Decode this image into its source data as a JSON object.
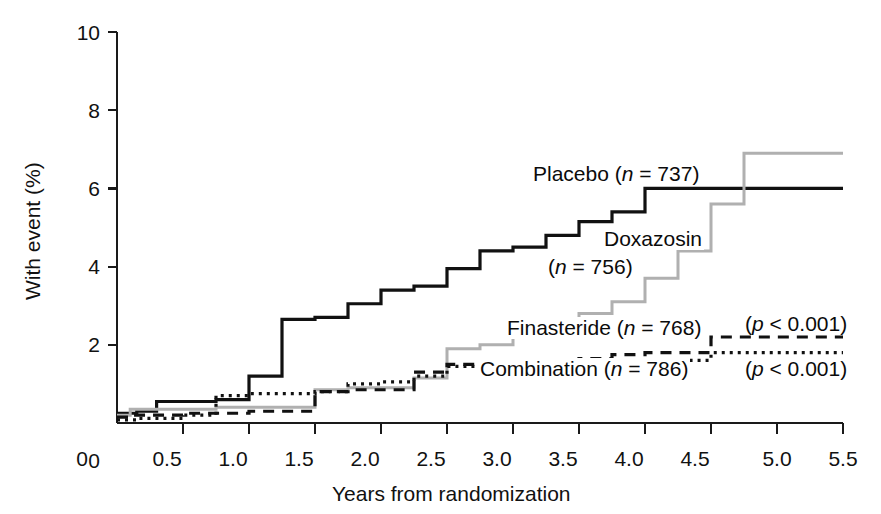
{
  "figure": {
    "background": "#ffffff",
    "width": 881,
    "height": 514
  },
  "axes": {
    "y_title": "With event (%)",
    "x_title": "Years from randomization",
    "y_ticks": [
      "0",
      "2",
      "4",
      "6",
      "8",
      "10"
    ],
    "x_ticks": [
      "0",
      "0.5",
      "1.0",
      "1.5",
      "2.0",
      "2.5",
      "3.0",
      "3.5",
      "4.0",
      "4.5",
      "5.0",
      "5.5"
    ],
    "axis_color": "#1a1a1a"
  },
  "annotations": {
    "placebo_label": "Placebo (",
    "placebo_n_italic": "n",
    "placebo_n_rest": " = 737)",
    "doxazosin_label_line1": "Doxazosin",
    "doxazosin_label_line2_pre": "(",
    "doxazosin_n_italic": "n",
    "doxazosin_n_rest": " = 756)",
    "finasteride_label": "Finasteride (",
    "finasteride_n_italic": "n",
    "finasteride_n_rest": " = 768)",
    "combination_label": "Combination (",
    "combination_n_italic": "n",
    "combination_n_rest": " = 786)",
    "pvalue_finasteride_pre": "(",
    "pvalue_finasteride_italic": "p",
    "pvalue_finasteride_rest": " < 0.001)",
    "pvalue_combination_pre": "(",
    "pvalue_combination_italic": "p",
    "pvalue_combination_rest": " < 0.001)"
  },
  "chart_data": {
    "type": "line",
    "subtype": "kaplan-meier-step",
    "title": "",
    "xlabel": "Years from randomization",
    "ylabel": "With event (%)",
    "xlim": [
      0,
      5.5
    ],
    "ylim": [
      0,
      10
    ],
    "xticks": [
      0,
      0.5,
      1.0,
      1.5,
      2.0,
      2.5,
      3.0,
      3.5,
      4.0,
      4.5,
      5.0,
      5.5
    ],
    "yticks": [
      0,
      2,
      4,
      6,
      8,
      10
    ],
    "grid": false,
    "legend": "inline-annotations",
    "series": [
      {
        "name": "Placebo (n = 737)",
        "n": 737,
        "color": "#111111",
        "style": "solid",
        "width": 3.2,
        "x": [
          0,
          0.15,
          0.3,
          0.75,
          1.0,
          1.25,
          1.5,
          1.75,
          2.0,
          2.25,
          2.5,
          2.75,
          3.0,
          3.25,
          3.5,
          3.75,
          4.0,
          5.5
        ],
        "y": [
          0.25,
          0.3,
          0.55,
          0.6,
          1.2,
          2.65,
          2.7,
          3.05,
          3.4,
          3.5,
          3.95,
          4.4,
          4.5,
          4.8,
          5.15,
          5.4,
          6.0,
          6.0
        ]
      },
      {
        "name": "Doxazosin (n = 756)",
        "n": 756,
        "color": "#b0b0b0",
        "style": "solid",
        "width": 3.0,
        "x": [
          0,
          0.1,
          0.75,
          1.5,
          1.75,
          2.25,
          2.5,
          2.75,
          3.0,
          3.25,
          3.5,
          3.75,
          4.0,
          4.25,
          4.5,
          4.75,
          5.5
        ],
        "y": [
          0.2,
          0.35,
          0.4,
          0.85,
          0.9,
          1.15,
          1.9,
          2.0,
          2.35,
          2.45,
          2.8,
          3.1,
          3.7,
          4.4,
          5.6,
          6.9,
          6.9
        ]
      },
      {
        "name": "Finasteride (n = 768)",
        "n": 768,
        "color": "#111111",
        "style": "dashed",
        "width": 3.2,
        "x": [
          0,
          0.1,
          0.5,
          1.0,
          1.5,
          1.75,
          2.25,
          2.5,
          2.75,
          3.0,
          3.5,
          3.75,
          4.0,
          4.5,
          5.5
        ],
        "y": [
          0.15,
          0.2,
          0.25,
          0.3,
          0.8,
          0.85,
          1.3,
          1.5,
          1.55,
          1.6,
          1.65,
          1.75,
          1.8,
          2.2,
          2.2
        ]
      },
      {
        "name": "Combination (n = 786)",
        "n": 786,
        "color": "#111111",
        "style": "dotted",
        "width": 3.2,
        "x": [
          0,
          0.15,
          0.5,
          0.75,
          1.0,
          1.5,
          1.75,
          2.0,
          2.25,
          2.5,
          2.75,
          3.0,
          3.5,
          4.5,
          5.5
        ],
        "y": [
          0.08,
          0.12,
          0.2,
          0.7,
          0.75,
          0.8,
          1.0,
          1.05,
          1.2,
          1.45,
          1.5,
          1.55,
          1.6,
          1.8,
          1.8
        ]
      }
    ],
    "pvalues": [
      {
        "series": "Finasteride",
        "text": "(p < 0.001)"
      },
      {
        "series": "Combination",
        "text": "(p < 0.001)"
      }
    ]
  },
  "geometry": {
    "plot_left": 117,
    "plot_right": 843,
    "plot_bottom": 423,
    "plot_top": 32
  }
}
